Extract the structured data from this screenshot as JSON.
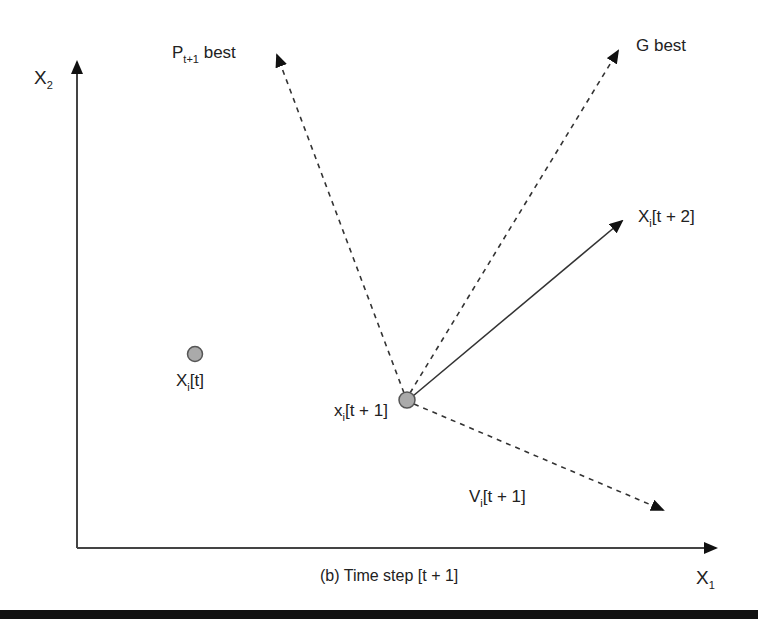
{
  "figure": {
    "caption": "(b) Time step [t + 1]",
    "axes": {
      "x_label": {
        "main": "X",
        "sub": "1"
      },
      "y_label": {
        "main": "X",
        "sub": "2"
      }
    },
    "points": [
      {
        "id": "xi_t",
        "label": {
          "main": "X",
          "sub": "i",
          "rest": "[t]"
        }
      },
      {
        "id": "xi_t1",
        "label": {
          "main": "x",
          "sub": "i",
          "rest": "[t + 1]"
        }
      }
    ],
    "vectors": [
      {
        "id": "p_best",
        "style": "dashed",
        "label": {
          "main": "P",
          "sub": "t+1",
          "rest": " best"
        }
      },
      {
        "id": "g_best",
        "style": "dashed",
        "label": {
          "main": "G best",
          "sub": "",
          "rest": ""
        }
      },
      {
        "id": "x_t2",
        "style": "solid",
        "label": {
          "main": "X",
          "sub": "i",
          "rest": "[t + 2]"
        }
      },
      {
        "id": "v_t1",
        "style": "dashed",
        "label": {
          "main": "V",
          "sub": "i",
          "rest": "[t + 1]"
        }
      }
    ],
    "colors": {
      "line": "#333333",
      "point_fill": "#aaaaaa",
      "point_stroke": "#555555",
      "bar": "#111111"
    }
  }
}
